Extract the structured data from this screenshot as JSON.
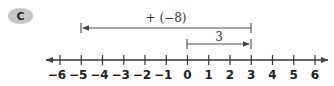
{
  "problem": {
    "label": "C"
  },
  "colors": {
    "badge": "#c6c6c6",
    "line": "#444444",
    "text": "#222222"
  },
  "number_line": {
    "min": -6,
    "max": 6,
    "ticks": [
      "−6",
      "−5",
      "−4",
      "−3",
      "−2",
      "−1",
      "0",
      "1",
      "2",
      "3",
      "4",
      "5",
      "6"
    ],
    "arrows": "both"
  },
  "brackets": [
    {
      "label": "3",
      "from": 0,
      "to": 3,
      "arrow_at": "end"
    },
    {
      "label": "+ (−8)",
      "from": 3,
      "to": -5,
      "arrow_at": "end"
    }
  ]
}
